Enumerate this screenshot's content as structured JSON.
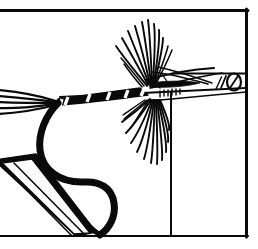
{
  "figure": {
    "title": "Fly tying step illustration",
    "style": "black-and-white pen-and-ink line drawing",
    "background_color": "#ffffff",
    "ink_color": "#0a0a0a",
    "canvas": {
      "width": 258,
      "height": 249
    }
  },
  "frame": {
    "top_rule": {
      "label": "top border rule",
      "y": 10,
      "x1": 0,
      "x2": 248,
      "thickness": 3
    },
    "right_rule": {
      "label": "right border rule",
      "x": 247,
      "y1": 10,
      "y2": 237,
      "thickness": 3
    },
    "bottom_rule": {
      "label": "bottom border rule",
      "y": 236,
      "x1": 0,
      "x2": 248,
      "thickness": 2
    },
    "inner_vertical_rule": {
      "label": "vise post vertical rule",
      "x": 171,
      "y1": 92,
      "y2": 236,
      "thickness": 2
    },
    "inner_horizontal_rule": {
      "label": "vise jaw top rule",
      "y": 73,
      "x1": 172,
      "x2": 247,
      "thickness": 2
    }
  },
  "parts": [
    {
      "id": "hook-eye",
      "label": "Hook eye",
      "note": "small oval ring at the far right end of the shank"
    },
    {
      "id": "hook-shank",
      "label": "Hook shank",
      "note": "straight wire running left to right"
    },
    {
      "id": "hook-bend",
      "label": "Hook bend",
      "note": "thick curved wire sweeping down and around"
    },
    {
      "id": "hook-point",
      "label": "Hook point",
      "note": "tapered tip at lower area of the bend"
    },
    {
      "id": "body",
      "label": "Wrapped body",
      "note": "dark thread/dubbing wraps with light rib segments"
    },
    {
      "id": "rib",
      "label": "Rib",
      "note": "five pale tinsel bands crossing the body"
    },
    {
      "id": "tail",
      "label": "Tail fibers",
      "note": "splayed fibers extending off the left edge"
    },
    {
      "id": "hackle",
      "label": "Hackle",
      "note": "radiating barbs fanning above and below the shank"
    },
    {
      "id": "wing",
      "label": "Wing",
      "note": "slim shapes angled back over the hackle"
    },
    {
      "id": "vise-jaw",
      "label": "Vise jaw",
      "note": "open V-shaped clamp at lower left gripping the hook"
    },
    {
      "id": "vise-post",
      "label": "Vise post",
      "note": "upright line supporting the jaw"
    }
  ],
  "colors": {
    "ink": "#0a0a0a",
    "paper": "#ffffff",
    "rib_highlight": "#ffffff"
  },
  "rib_segments": [
    {
      "x": 66,
      "angle": -62
    },
    {
      "x": 88,
      "angle": -62
    },
    {
      "x": 108,
      "angle": -62
    },
    {
      "x": 126,
      "angle": -62
    },
    {
      "x": 143,
      "angle": -62
    }
  ],
  "hackle_upper_fibers": [
    {
      "x2": 116,
      "y2": 46
    },
    {
      "x2": 122,
      "y2": 38
    },
    {
      "x2": 128,
      "y2": 31
    },
    {
      "x2": 135,
      "y2": 26
    },
    {
      "x2": 142,
      "y2": 22
    },
    {
      "x2": 148,
      "y2": 20
    },
    {
      "x2": 154,
      "y2": 24
    },
    {
      "x2": 159,
      "y2": 30
    },
    {
      "x2": 163,
      "y2": 38
    }
  ],
  "hackle_lower_fibers": [
    {
      "x2": 122,
      "y2": 122
    },
    {
      "x2": 126,
      "y2": 133
    },
    {
      "x2": 131,
      "y2": 143
    },
    {
      "x2": 137,
      "y2": 152
    },
    {
      "x2": 144,
      "y2": 159
    },
    {
      "x2": 151,
      "y2": 163
    },
    {
      "x2": 157,
      "y2": 164
    },
    {
      "x2": 162,
      "y2": 160
    },
    {
      "x2": 166,
      "y2": 152
    },
    {
      "x2": 168,
      "y2": 142
    },
    {
      "x2": 169,
      "y2": 130
    }
  ],
  "tail_fibers": [
    {
      "y2": 90
    },
    {
      "y2": 96
    },
    {
      "y2": 102
    },
    {
      "y2": 108
    },
    {
      "y2": 114
    }
  ]
}
